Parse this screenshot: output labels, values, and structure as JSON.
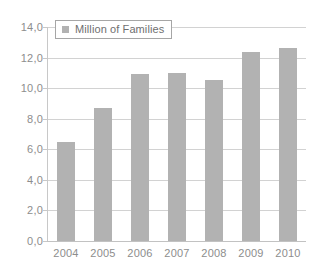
{
  "chart_data": {
    "type": "bar",
    "title": "",
    "xlabel": "",
    "ylabel": "",
    "categories": [
      "2004",
      "2005",
      "2006",
      "2007",
      "2008",
      "2009",
      "2010"
    ],
    "values": [
      6.5,
      8.7,
      10.9,
      11.0,
      10.5,
      12.35,
      12.6
    ],
    "series": [
      {
        "name": "Million of Families",
        "values": [
          6.5,
          8.7,
          10.9,
          11.0,
          10.5,
          12.35,
          12.6
        ],
        "color": "#b2b2b2"
      }
    ],
    "ylim": [
      0,
      14
    ],
    "ytick_step": 2,
    "ytick_labels": [
      "0,0",
      "2,0",
      "4,0",
      "6,0",
      "8,0",
      "10,0",
      "12,0",
      "14,0"
    ],
    "ytick_values": [
      0,
      2,
      4,
      6,
      8,
      10,
      12,
      14
    ],
    "grid": true,
    "grid_color": "#d2d2d2",
    "legend": {
      "position": "top-left-inside",
      "entries": [
        {
          "label": "Million of Families",
          "swatch_color": "#b2b2b2"
        }
      ]
    },
    "decimal_separator": ",",
    "bar_color": "#b2b2b2",
    "background": "#ffffff",
    "axis_color": "#c8c8c8",
    "tick_label_color": "#8d8d8d"
  }
}
